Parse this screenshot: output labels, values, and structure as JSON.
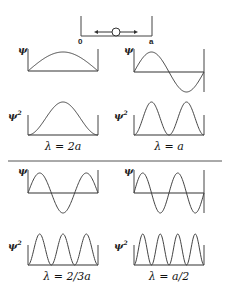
{
  "box": {
    "left_label": "0",
    "right_label": "a",
    "particle": "circle with double arrow"
  },
  "panels": [
    {
      "id": "n1",
      "label": "ψ",
      "wavelength": "λ = 2a",
      "half_waves": 1
    },
    {
      "id": "n2",
      "label": "ψ",
      "wavelength": "λ = a",
      "half_waves": 2
    },
    {
      "id": "n3",
      "label": "ψ",
      "wavelength": "λ = 2/3 a",
      "half_waves": 3
    },
    {
      "id": "n4",
      "label": "ψ",
      "wavelength": "λ = a/2",
      "half_waves": 4
    }
  ],
  "psi_label": "ψ",
  "psi2_label": "ψ",
  "psi2_sup": "2",
  "lambda_labels": [
    "λ = 2a",
    "λ = a",
    "λ = 2/3a",
    "λ = a/2"
  ]
}
